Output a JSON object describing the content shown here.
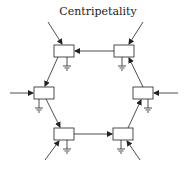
{
  "diagram": {
    "title": "Centripetality",
    "colors": {
      "stroke": "#222222",
      "background": "#ffffff"
    },
    "nodes": [
      {
        "id": "top-left",
        "x": 54,
        "y": 45,
        "w": 20,
        "h": 12
      },
      {
        "id": "top-right",
        "x": 114,
        "y": 45,
        "w": 20,
        "h": 12
      },
      {
        "id": "mid-left",
        "x": 34,
        "y": 87,
        "w": 20,
        "h": 12
      },
      {
        "id": "mid-right",
        "x": 133,
        "y": 87,
        "w": 20,
        "h": 12
      },
      {
        "id": "bottom-left",
        "x": 54,
        "y": 128,
        "w": 20,
        "h": 12
      },
      {
        "id": "bottom-right",
        "x": 113,
        "y": 128,
        "w": 20,
        "h": 12
      }
    ],
    "edges": [
      {
        "from": "top-right",
        "to": "top-left"
      },
      {
        "from": "top-left",
        "to": "mid-left"
      },
      {
        "from": "mid-left",
        "to": "bottom-left"
      },
      {
        "from": "bottom-left",
        "to": "bottom-right"
      },
      {
        "from": "bottom-right",
        "to": "mid-right"
      },
      {
        "from": "mid-right",
        "to": "top-right"
      }
    ],
    "external_inputs": [
      {
        "target": "top-left",
        "direction": "from upper-left"
      },
      {
        "target": "top-right",
        "direction": "from upper-right"
      },
      {
        "target": "mid-left",
        "direction": "from left"
      },
      {
        "target": "mid-right",
        "direction": "from right"
      },
      {
        "target": "bottom-left",
        "direction": "from lower-left"
      },
      {
        "target": "bottom-right",
        "direction": "from lower-right"
      }
    ],
    "ground_symbols": 6
  }
}
